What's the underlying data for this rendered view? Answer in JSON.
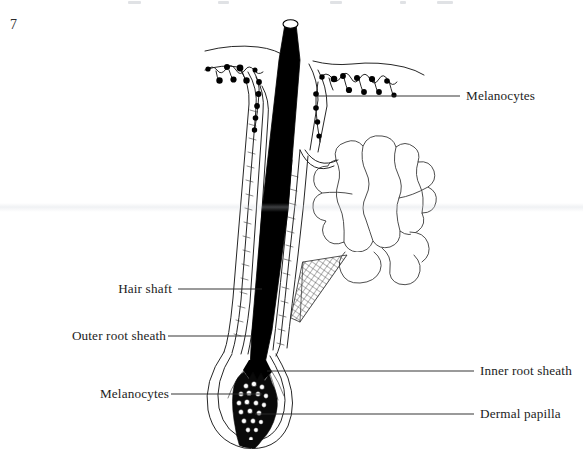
{
  "page": {
    "folio": "7",
    "width": 583,
    "height": 461,
    "background": "#ffffff",
    "ink": "#000000",
    "text_color": "#1c1c1c"
  },
  "figure": {
    "type": "anatomical-line-diagram",
    "structures": [
      "hair shaft",
      "epidermis surface",
      "outer root sheath",
      "inner root sheath",
      "sebaceous gland",
      "sebaceous duct",
      "hair bulb",
      "dermal papilla",
      "melanocytes"
    ]
  },
  "labels": {
    "left": [
      {
        "text": "Hair shaft",
        "x": 172,
        "y": 289,
        "leader_x1": 178,
        "leader_x2": 262,
        "leader_y": 289
      },
      {
        "text": "Outer root sheath",
        "x": 162,
        "y": 336,
        "leader_x1": 168,
        "leader_x2": 252,
        "leader_y": 336
      },
      {
        "text": "Melanocytes",
        "x": 165,
        "y": 394,
        "leader_x1": 171,
        "leader_x2": 262,
        "leader_y": 394
      }
    ],
    "right": [
      {
        "text": "Melanocytes",
        "x": 466,
        "y": 96,
        "leader_x1": 318,
        "leader_x2": 460,
        "leader_y": 96
      },
      {
        "text": "Inner root sheath",
        "x": 480,
        "y": 371,
        "leader_x1": 267,
        "leader_x2": 474,
        "leader_y": 371
      },
      {
        "text": "Dermal papilla",
        "x": 480,
        "y": 414,
        "leader_x1": 255,
        "leader_x2": 474,
        "leader_y": 414
      }
    ]
  },
  "colors": {
    "hair_shaft_fill": "#000000",
    "outline": "#1a1a1a",
    "melanocyte_dot": "#000000",
    "paper": "#ffffff",
    "gland_outline": "#3a3a3a"
  }
}
